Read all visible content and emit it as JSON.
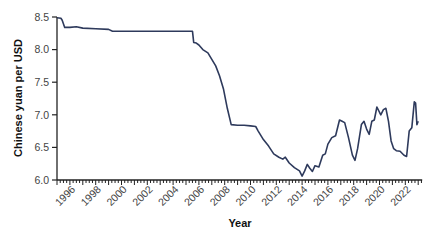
{
  "chart_data": {
    "type": "line",
    "title": "",
    "xlabel": "Year",
    "ylabel": "Chinese yuan per USD",
    "xlim": [
      1995.0,
      2023.0
    ],
    "ylim": [
      6.0,
      8.5
    ],
    "grid": false,
    "legend": null,
    "y_ticks": [
      6.0,
      6.5,
      7.0,
      7.5,
      8.0,
      8.5
    ],
    "y_tick_labels": [
      "6.0",
      "6.5",
      "7.0",
      "7.5",
      "8.0",
      "8.5"
    ],
    "x_tick_labels": [
      "1996",
      "1998",
      "2000",
      "2002",
      "2004",
      "2006",
      "2008",
      "2010",
      "2012",
      "2014",
      "2016",
      "2018",
      "2020",
      "2022"
    ],
    "x_ticks": [
      1996,
      1998,
      2000,
      2002,
      2004,
      2006,
      2008,
      2010,
      2012,
      2014,
      2016,
      2018,
      2020,
      2022
    ],
    "line_color": "#2e3a5c",
    "series": [
      {
        "name": "CNY per USD",
        "x": [
          1995.0,
          1995.3,
          1995.4,
          1995.6,
          1996.0,
          1996.5,
          1997.0,
          1998.0,
          1999.0,
          1999.3,
          1999.5,
          2000.0,
          2002.0,
          2004.0,
          2005.5,
          2005.6,
          2005.8,
          2006.0,
          2006.3,
          2006.7,
          2007.0,
          2007.3,
          2007.6,
          2007.9,
          2008.2,
          2008.5,
          2009.0,
          2009.5,
          2010.0,
          2010.4,
          2010.6,
          2011.0,
          2011.4,
          2011.8,
          2012.2,
          2012.5,
          2012.7,
          2013.0,
          2013.4,
          2013.8,
          2014.0,
          2014.2,
          2014.4,
          2014.6,
          2014.8,
          2015.0,
          2015.3,
          2015.6,
          2015.8,
          2016.0,
          2016.3,
          2016.6,
          2016.9,
          2017.1,
          2017.3,
          2017.6,
          2017.9,
          2018.1,
          2018.3,
          2018.6,
          2018.8,
          2019.0,
          2019.2,
          2019.4,
          2019.6,
          2019.8,
          2020.1,
          2020.3,
          2020.5,
          2020.7,
          2020.9,
          2021.1,
          2021.3,
          2021.6,
          2021.9,
          2022.1,
          2022.3,
          2022.5,
          2022.7,
          2022.8,
          2022.9,
          2023.0
        ],
        "values": [
          8.49,
          8.48,
          8.45,
          8.34,
          8.34,
          8.35,
          8.33,
          8.32,
          8.31,
          8.28,
          8.28,
          8.28,
          8.28,
          8.28,
          8.28,
          8.11,
          8.1,
          8.07,
          8.0,
          7.95,
          7.85,
          7.75,
          7.6,
          7.4,
          7.1,
          6.85,
          6.84,
          6.84,
          6.83,
          6.82,
          6.75,
          6.62,
          6.52,
          6.4,
          6.35,
          6.32,
          6.35,
          6.26,
          6.19,
          6.14,
          6.06,
          6.14,
          6.24,
          6.18,
          6.13,
          6.22,
          6.2,
          6.38,
          6.4,
          6.55,
          6.65,
          6.68,
          6.92,
          6.9,
          6.88,
          6.65,
          6.38,
          6.3,
          6.48,
          6.85,
          6.9,
          6.78,
          6.7,
          6.9,
          6.92,
          7.12,
          7.0,
          7.08,
          7.1,
          6.9,
          6.6,
          6.48,
          6.45,
          6.44,
          6.38,
          6.36,
          6.75,
          6.8,
          7.2,
          7.18,
          6.85,
          6.9
        ]
      }
    ]
  }
}
